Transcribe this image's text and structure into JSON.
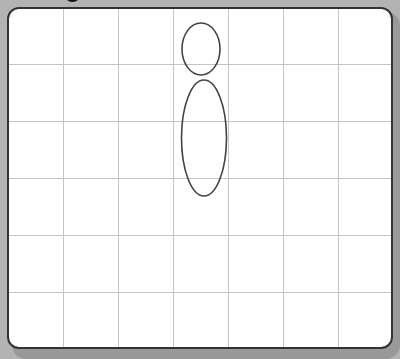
{
  "canvas": {
    "background": "#b3b3b3",
    "card_fill": "#ffffff",
    "card_border": "#333333",
    "grid_color": "#c4c4c4",
    "stroke_color": "#444444"
  },
  "grid": {
    "columns": 7,
    "rows": 6,
    "vertical_lines_x": [
      63,
      118,
      173,
      228,
      283,
      338
    ],
    "horizontal_lines_y": [
      64,
      121,
      178,
      235,
      292
    ]
  },
  "shapes": [
    {
      "type": "ellipse",
      "name": "small-ellipse",
      "cx": 201,
      "cy": 49,
      "rx": 19,
      "ry": 26
    },
    {
      "type": "ellipse",
      "name": "large-ellipse",
      "cx": 204,
      "cy": 138,
      "rx": 22.5,
      "ry": 58
    }
  ]
}
